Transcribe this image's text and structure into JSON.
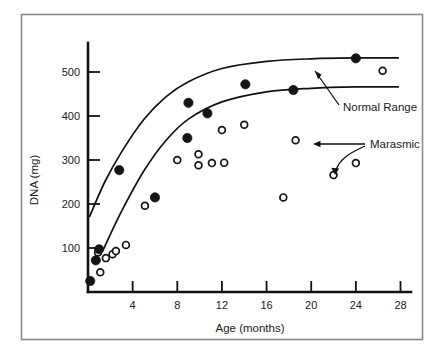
{
  "figure": {
    "background_color": "#ffffff",
    "frame_color": "#8a8a8a",
    "ink_color": "#141414"
  },
  "chart_data": {
    "type": "scatter",
    "title": "",
    "subtitle": "",
    "xlabel": "Age (months)",
    "ylabel": "DNA (mg)",
    "xlim": [
      0,
      28
    ],
    "ylim": [
      0,
      560
    ],
    "xticks": [
      4,
      8,
      12,
      16,
      20,
      24,
      28
    ],
    "xticklabels": [
      "4",
      "8",
      "12",
      "16",
      "20",
      "24",
      "28"
    ],
    "yticks": [
      100,
      200,
      300,
      400,
      500
    ],
    "yticklabels": [
      "100",
      "200",
      "300",
      "400",
      "500"
    ],
    "grid": false,
    "legend_position": "none",
    "annotations": [
      {
        "name": "normal-range-annotation",
        "text": "Normal Range",
        "text_x": 21.0,
        "text_y": 398,
        "points_to_x": 18.6,
        "points_to_y": 480
      },
      {
        "name": "marasmic-annotation",
        "text": "Marasmic",
        "text_x": 24.6,
        "text_y": 345,
        "points_to_x": 18.6,
        "points_to_y": 345
      }
    ],
    "series": [
      {
        "name": "Normal",
        "marker": "filled-circle",
        "color": "#141414",
        "points": [
          {
            "x": 0.2,
            "y": 25
          },
          {
            "x": 0.7,
            "y": 72
          },
          {
            "x": 1.0,
            "y": 97
          },
          {
            "x": 2.8,
            "y": 277
          },
          {
            "x": 6.0,
            "y": 215
          },
          {
            "x": 8.9,
            "y": 350
          },
          {
            "x": 9.0,
            "y": 430
          },
          {
            "x": 10.7,
            "y": 406
          },
          {
            "x": 14.1,
            "y": 472
          },
          {
            "x": 18.4,
            "y": 459
          },
          {
            "x": 24.0,
            "y": 531
          }
        ]
      },
      {
        "name": "Marasmic",
        "marker": "open-circle",
        "color": "#141414",
        "points": [
          {
            "x": 0.9,
            "y": 90
          },
          {
            "x": 1.1,
            "y": 45
          },
          {
            "x": 1.6,
            "y": 77
          },
          {
            "x": 2.2,
            "y": 86
          },
          {
            "x": 2.5,
            "y": 93
          },
          {
            "x": 3.4,
            "y": 107
          },
          {
            "x": 5.1,
            "y": 196
          },
          {
            "x": 8.0,
            "y": 300
          },
          {
            "x": 9.9,
            "y": 313
          },
          {
            "x": 9.9,
            "y": 288
          },
          {
            "x": 11.1,
            "y": 293
          },
          {
            "x": 12.2,
            "y": 294
          },
          {
            "x": 12.0,
            "y": 368
          },
          {
            "x": 14.0,
            "y": 380
          },
          {
            "x": 17.5,
            "y": 215
          },
          {
            "x": 18.6,
            "y": 345
          },
          {
            "x": 22.0,
            "y": 266
          },
          {
            "x": 24.0,
            "y": 293
          },
          {
            "x": 26.4,
            "y": 503
          }
        ]
      }
    ],
    "curves": [
      {
        "name": "normal-upper-curve",
        "description": "Upper bound of normal range, rising saturating curve",
        "points": [
          {
            "x": 0.15,
            "y": 172
          },
          {
            "x": 1.5,
            "y": 250
          },
          {
            "x": 3.0,
            "y": 318
          },
          {
            "x": 5.0,
            "y": 392
          },
          {
            "x": 7.0,
            "y": 444
          },
          {
            "x": 9.0,
            "y": 478
          },
          {
            "x": 12.0,
            "y": 508
          },
          {
            "x": 16.0,
            "y": 524
          },
          {
            "x": 20.0,
            "y": 530
          },
          {
            "x": 24.0,
            "y": 532
          },
          {
            "x": 27.8,
            "y": 532
          }
        ]
      },
      {
        "name": "normal-lower-curve",
        "description": "Lower bound of normal range, rising saturating curve",
        "points": [
          {
            "x": 1.4,
            "y": 98
          },
          {
            "x": 3.0,
            "y": 183
          },
          {
            "x": 5.0,
            "y": 275
          },
          {
            "x": 7.0,
            "y": 345
          },
          {
            "x": 9.0,
            "y": 393
          },
          {
            "x": 12.0,
            "y": 432
          },
          {
            "x": 16.0,
            "y": 455
          },
          {
            "x": 20.0,
            "y": 463
          },
          {
            "x": 24.0,
            "y": 466
          },
          {
            "x": 27.8,
            "y": 466
          }
        ]
      }
    ]
  }
}
